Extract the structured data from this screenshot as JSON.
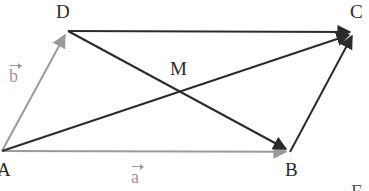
{
  "figure": {
    "type": "geometry-diagram",
    "width": 369,
    "height": 191,
    "background": "#ffffff",
    "colors": {
      "gray_vector": "#9a9a9a",
      "black_vector": "#2b2b2b",
      "label_text": "#2a2a2a",
      "gray_label_text": "#9a9a9a"
    },
    "points": [
      {
        "id": "A",
        "label": "A",
        "x": 2,
        "y": 151,
        "label_x": -3,
        "label_y": 160
      },
      {
        "id": "B",
        "label": "B",
        "x": 290,
        "y": 152,
        "label_x": 285,
        "label_y": 160
      },
      {
        "id": "C",
        "label": "C",
        "x": 355,
        "y": 31,
        "label_x": 350,
        "label_y": 2
      },
      {
        "id": "D",
        "label": "D",
        "x": 68,
        "y": 31,
        "label_x": 56,
        "label_y": 2
      },
      {
        "id": "M",
        "label": "M",
        "x": 178,
        "y": 88,
        "label_x": 170,
        "label_y": 59
      }
    ],
    "segments": [
      {
        "id": "AB",
        "from": "A",
        "to": "B",
        "color": "#9a9a9a",
        "width": 2,
        "arrow": "end",
        "vector_label": "a"
      },
      {
        "id": "AD",
        "from": "A",
        "to": "D",
        "color": "#9a9a9a",
        "width": 2,
        "arrow": "end",
        "vector_label": "b"
      },
      {
        "id": "DC",
        "from": "D",
        "to": "C",
        "color": "#2b2b2b",
        "width": 2,
        "arrow": "end",
        "vector_label": ""
      },
      {
        "id": "BC",
        "from": "B",
        "to": "C",
        "color": "#2b2b2b",
        "width": 2,
        "arrow": "end",
        "vector_label": ""
      },
      {
        "id": "AC",
        "from": "A",
        "to": "C",
        "color": "#2b2b2b",
        "width": 2,
        "arrow": "end",
        "vector_label": ""
      },
      {
        "id": "DB",
        "from": "D",
        "to": "B",
        "color": "#2b2b2b",
        "width": 2,
        "arrow": "end",
        "vector_label": ""
      }
    ],
    "vector_labels": [
      {
        "id": "a",
        "glyph": "a",
        "x": 131,
        "y": 163,
        "color": "#9a9a9a"
      },
      {
        "id": "b",
        "glyph": "b",
        "x": 9,
        "y": 62,
        "color": "#9a9a9a"
      }
    ],
    "corner_partial_label": "E"
  }
}
